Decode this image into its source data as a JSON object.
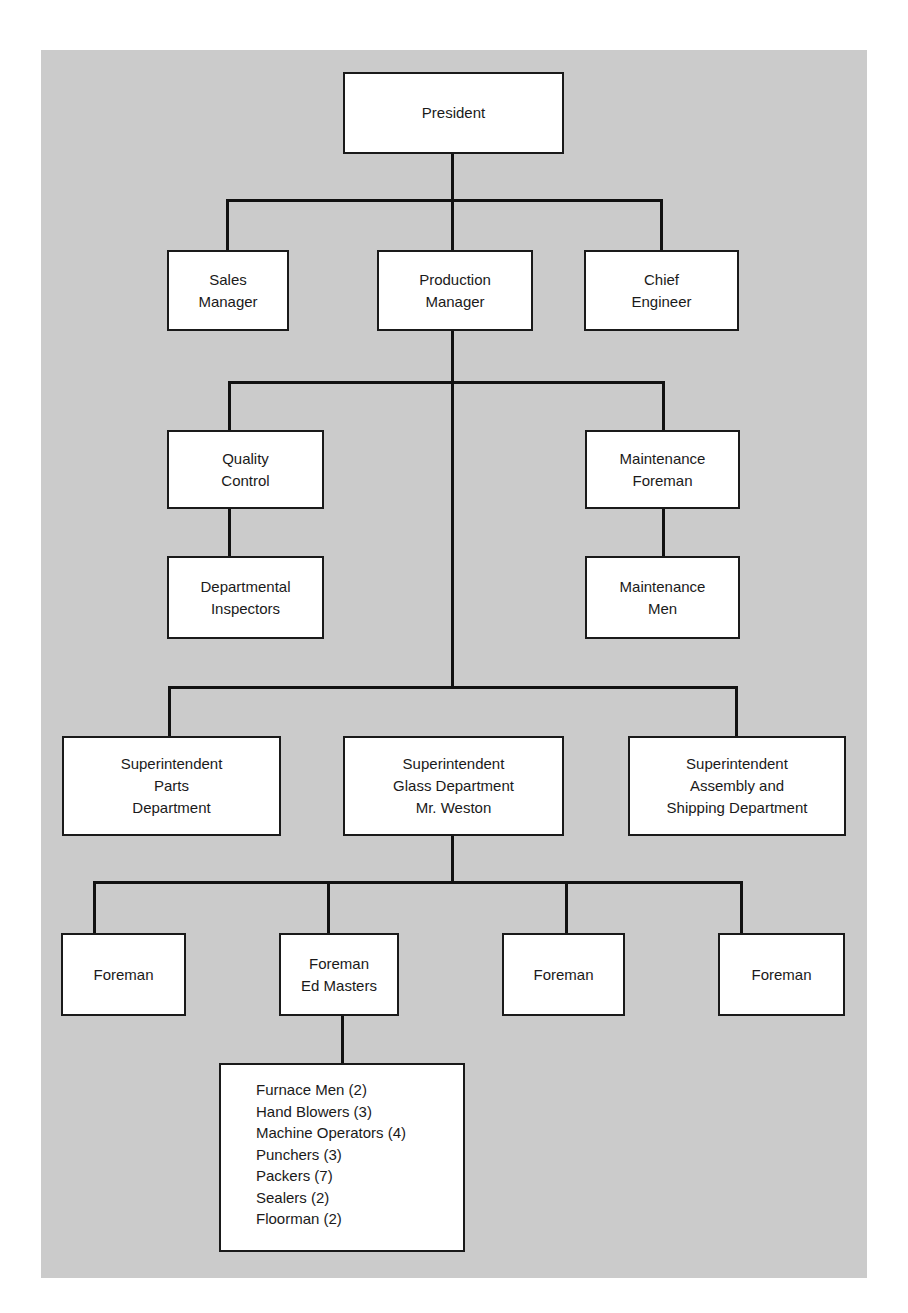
{
  "diagram": {
    "type": "organization-chart",
    "nodes": {
      "president": "President",
      "sales_manager": "Sales\nManager",
      "production_manager": "Production\nManager",
      "chief_engineer": "Chief\nEngineer",
      "quality_control": "Quality\nControl",
      "departmental_inspectors": "Departmental\nInspectors",
      "maintenance_foreman": "Maintenance\nForeman",
      "maintenance_men": "Maintenance\nMen",
      "supt_parts": "Superintendent\nParts\nDepartment",
      "supt_glass": "Superintendent\nGlass Department\nMr. Weston",
      "supt_assembly": "Superintendent\nAssembly and\nShipping Department",
      "foreman_1": "Foreman",
      "foreman_ed_masters": "Foreman\nEd Masters",
      "foreman_3": "Foreman",
      "foreman_4": "Foreman"
    },
    "crew": [
      "Furnace Men (2)",
      "Hand Blowers (3)",
      "Machine Operators (4)",
      "Punchers (3)",
      "Packers (7)",
      "Sealers (2)",
      "Floorman (2)"
    ],
    "edges": [
      [
        "president",
        "sales_manager"
      ],
      [
        "president",
        "production_manager"
      ],
      [
        "president",
        "chief_engineer"
      ],
      [
        "production_manager",
        "quality_control"
      ],
      [
        "production_manager",
        "maintenance_foreman"
      ],
      [
        "quality_control",
        "departmental_inspectors"
      ],
      [
        "maintenance_foreman",
        "maintenance_men"
      ],
      [
        "production_manager",
        "supt_parts"
      ],
      [
        "production_manager",
        "supt_glass"
      ],
      [
        "production_manager",
        "supt_assembly"
      ],
      [
        "supt_glass",
        "foreman_1"
      ],
      [
        "supt_glass",
        "foreman_ed_masters"
      ],
      [
        "supt_glass",
        "foreman_3"
      ],
      [
        "supt_glass",
        "foreman_4"
      ],
      [
        "foreman_ed_masters",
        "crew"
      ]
    ]
  }
}
